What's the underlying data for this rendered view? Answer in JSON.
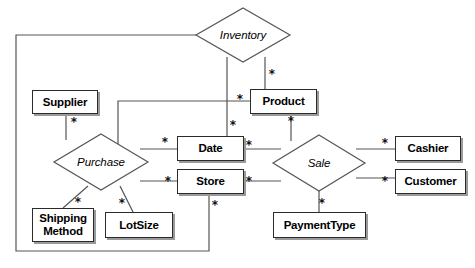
{
  "diagram": {
    "type": "entity-relationship-diagram",
    "canvas": {
      "width": 475,
      "height": 268,
      "background": "#ffffff"
    },
    "style": {
      "line_color": "#555555",
      "box_border_color": "#2b2b2b",
      "box_shadow_color": "#9a9a9a",
      "text_color": "#000000"
    },
    "entities": [
      {
        "id": "supplier",
        "label": "Supplier",
        "x": 32,
        "y": 90,
        "w": 66,
        "h": 24,
        "lines": [
          "Supplier"
        ]
      },
      {
        "id": "product",
        "label": "Product",
        "x": 250,
        "y": 89,
        "w": 67,
        "h": 25,
        "lines": [
          "Product"
        ]
      },
      {
        "id": "date",
        "label": "Date",
        "x": 177,
        "y": 136,
        "w": 67,
        "h": 25,
        "lines": [
          "Date"
        ]
      },
      {
        "id": "store",
        "label": "Store",
        "x": 177,
        "y": 169,
        "w": 67,
        "h": 25,
        "lines": [
          "Store"
        ]
      },
      {
        "id": "cashier",
        "label": "Cashier",
        "x": 395,
        "y": 136,
        "w": 66,
        "h": 25,
        "lines": [
          "Cashier"
        ]
      },
      {
        "id": "customer",
        "label": "Customer",
        "x": 395,
        "y": 169,
        "w": 71,
        "h": 25,
        "lines": [
          "Customer"
        ]
      },
      {
        "id": "shippingmethod",
        "label": "Shipping Method",
        "x": 32,
        "y": 208,
        "w": 62,
        "h": 34,
        "lines": [
          "Shipping",
          "Method"
        ]
      },
      {
        "id": "lotsize",
        "label": "LotSize",
        "x": 105,
        "y": 212,
        "w": 68,
        "h": 26,
        "lines": [
          "LotSize"
        ]
      },
      {
        "id": "paymenttype",
        "label": "PaymentType",
        "x": 273,
        "y": 212,
        "w": 93,
        "h": 26,
        "lines": [
          "PaymentType"
        ]
      }
    ],
    "relationships": [
      {
        "id": "inventory",
        "label": "Inventory",
        "cx": 243,
        "cy": 35,
        "rx": 47,
        "ry": 27
      },
      {
        "id": "purchase",
        "label": "Purchase",
        "cx": 101,
        "cy": 162,
        "rx": 47,
        "ry": 28
      },
      {
        "id": "sale",
        "label": "Sale",
        "cx": 319,
        "cy": 163,
        "rx": 46,
        "ry": 28
      }
    ],
    "cardinality_symbol": "*",
    "cardinality_marks": [
      {
        "id": "inv-product",
        "x": 272,
        "y": 74,
        "between": [
          "Inventory",
          "Product"
        ]
      },
      {
        "id": "inv-date",
        "x": 233,
        "y": 125,
        "between": [
          "Inventory",
          "Date"
        ]
      },
      {
        "id": "supplier-purchase",
        "x": 74,
        "y": 122,
        "between": [
          "Supplier",
          "Purchase"
        ]
      },
      {
        "id": "product-purchase",
        "x": 240,
        "y": 99,
        "between": [
          "Product",
          "Purchase"
        ]
      },
      {
        "id": "product-sale",
        "x": 291,
        "y": 121,
        "between": [
          "Product",
          "Sale"
        ]
      },
      {
        "id": "purchase-date",
        "x": 165,
        "y": 142,
        "between": [
          "Purchase",
          "Date"
        ]
      },
      {
        "id": "date-sale",
        "x": 249,
        "y": 145,
        "between": [
          "Date",
          "Sale"
        ]
      },
      {
        "id": "sale-cashier",
        "x": 385,
        "y": 143,
        "between": [
          "Sale",
          "Cashier"
        ]
      },
      {
        "id": "sale-customer",
        "x": 385,
        "y": 181,
        "between": [
          "Sale",
          "Customer"
        ]
      },
      {
        "id": "purchase-store",
        "x": 168,
        "y": 181,
        "between": [
          "Purchase",
          "Store"
        ]
      },
      {
        "id": "store-sale",
        "x": 249,
        "y": 181,
        "between": [
          "Store",
          "Sale"
        ]
      },
      {
        "id": "purchase-shipping",
        "x": 78,
        "y": 202,
        "between": [
          "Purchase",
          "ShippingMethod"
        ]
      },
      {
        "id": "purchase-lotsize",
        "x": 122,
        "y": 203,
        "between": [
          "Purchase",
          "LotSize"
        ]
      },
      {
        "id": "sale-paymenttype",
        "x": 322,
        "y": 203,
        "between": [
          "Sale",
          "PaymentType"
        ]
      },
      {
        "id": "store-inventory",
        "x": 215,
        "y": 205,
        "between": [
          "Store",
          "Inventory"
        ]
      }
    ],
    "connector_paths": [
      {
        "id": "inventory-to-product",
        "d": "M 265 57 L 265 89"
      },
      {
        "id": "inventory-to-date",
        "d": "M 227 57 L 227 136"
      },
      {
        "id": "inventory-left-to-store-loop",
        "d": "M 196 35 L 16 35 L 16 251 L 209 251 L 209 194"
      },
      {
        "id": "supplier-to-purchase",
        "d": "M 66 114 L 66 140"
      },
      {
        "id": "product-to-purchase",
        "d": "M 250 101 L 118 101 L 118 152"
      },
      {
        "id": "product-to-sale",
        "d": "M 291 114 L 291 141"
      },
      {
        "id": "purchase-to-date",
        "d": "M 140 149 L 177 149"
      },
      {
        "id": "date-to-sale",
        "d": "M 244 149 L 281 149"
      },
      {
        "id": "sale-to-cashier",
        "d": "M 356 149 L 395 149"
      },
      {
        "id": "sale-to-customer",
        "d": "M 356 178 L 395 178"
      },
      {
        "id": "purchase-to-store",
        "d": "M 140 181 L 177 181"
      },
      {
        "id": "store-to-sale",
        "d": "M 244 181 L 281 181"
      },
      {
        "id": "purchase-to-shipping",
        "d": "M 88 186 L 63 208"
      },
      {
        "id": "purchase-to-lotsize",
        "d": "M 120 186 L 133 212"
      },
      {
        "id": "sale-to-paymenttype",
        "d": "M 319 191 L 319 212"
      }
    ]
  }
}
